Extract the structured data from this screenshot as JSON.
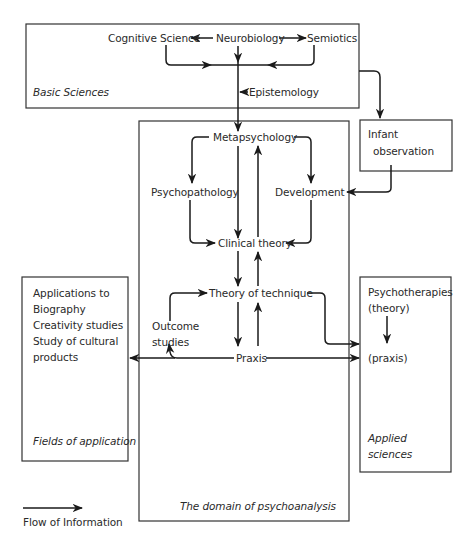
{
  "diagram": {
    "type": "flow-diagram",
    "boxes": {
      "basic_sciences": {
        "label": "Basic Sciences"
      },
      "infant_observation": {
        "label_line1": "Infant",
        "label_line2": "observation"
      },
      "domain_of_psychoanalysis": {
        "label": "The domain of psychoanalysis"
      },
      "fields_of_application": {
        "label": "Fields of application",
        "items": [
          "Applications to",
          "Biography",
          "Creativity studies",
          "Study of cultural",
          "products"
        ]
      },
      "applied_sciences": {
        "label_line1": "Applied",
        "label_line2": "sciences",
        "items": [
          "Psychotherapies",
          "(theory)",
          "(praxis)"
        ]
      }
    },
    "nodes": {
      "cognitive_science": "Cognitive Science",
      "neurobiology": "Neurobiology",
      "semiotics": "Semiotics",
      "epistemology": "Epistemology",
      "metapsychology": "Metapsychology",
      "psychopathology": "Psychopathology",
      "development": "Development",
      "clinical_theory": "Clinical theory",
      "theory_of_technique": "Theory of technique",
      "outcome_studies_line1": "Outcome",
      "outcome_studies_line2": "studies",
      "praxis": "Praxis"
    },
    "edges": [
      {
        "from": "Neurobiology",
        "to": "Cognitive Science"
      },
      {
        "from": "Neurobiology",
        "to": "Semiotics"
      },
      {
        "from": "Cognitive Science",
        "to": "Basic Sciences trunk"
      },
      {
        "from": "Semiotics",
        "to": "Basic Sciences trunk"
      },
      {
        "from": "Neurobiology",
        "to": "Basic Sciences trunk"
      },
      {
        "from": "Epistemology",
        "to": "Basic Sciences trunk"
      },
      {
        "from": "Basic Sciences",
        "to": "Metapsychology"
      },
      {
        "from": "Basic Sciences",
        "to": "Infant observation"
      },
      {
        "from": "Infant observation",
        "to": "Development"
      },
      {
        "from": "Metapsychology",
        "to": "Psychopathology"
      },
      {
        "from": "Metapsychology",
        "to": "Development"
      },
      {
        "from": "Metapsychology",
        "to": "Clinical theory"
      },
      {
        "from": "Clinical theory",
        "to": "Metapsychology"
      },
      {
        "from": "Psychopathology",
        "to": "Clinical theory"
      },
      {
        "from": "Development",
        "to": "Clinical theory"
      },
      {
        "from": "Clinical theory",
        "to": "Theory of technique"
      },
      {
        "from": "Theory of technique",
        "to": "Clinical theory"
      },
      {
        "from": "Theory of technique",
        "to": "Praxis"
      },
      {
        "from": "Praxis",
        "to": "Theory of technique"
      },
      {
        "from": "Outcome studies",
        "to": "Theory of technique"
      },
      {
        "from": "Praxis",
        "to": "Outcome studies"
      },
      {
        "from": "Praxis",
        "to": "Fields of application"
      },
      {
        "from": "Praxis",
        "to": "Applied sciences (praxis)"
      },
      {
        "from": "Theory of technique",
        "to": "Applied sciences"
      },
      {
        "from": "Psychotherapies (theory)",
        "to": "(praxis)"
      }
    ]
  },
  "legend": {
    "arrow_label": "Flow of Information"
  }
}
